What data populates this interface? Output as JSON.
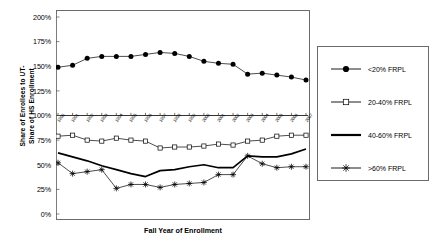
{
  "chart_data": {
    "type": "line",
    "title": "",
    "xlabel": "Fall Year of Enrollment",
    "ylabel": "Share of Enrollees to UT- Share of HS Enrollment",
    "ylabel_lines": [
      "Share of Enrollees to UT-",
      "Share of HS Enrollment"
    ],
    "x": [
      1990,
      1991,
      1992,
      1993,
      1994,
      1995,
      1996,
      1997,
      1998,
      1999,
      2000,
      2001,
      2002,
      2003,
      2004,
      2005,
      2006,
      2007
    ],
    "categories": [
      "1990",
      "1991",
      "1992",
      "1993",
      "1994",
      "1995",
      "1996",
      "1997",
      "1998",
      "1999",
      "2000",
      "2001",
      "2002",
      "2003",
      "2004",
      "2005",
      "2006",
      "2007"
    ],
    "ylim": [
      0,
      200
    ],
    "yticks": [
      0,
      25,
      50,
      75,
      100,
      125,
      150,
      175,
      200
    ],
    "ytick_labels": [
      "0%",
      "25%",
      "50%",
      "75%",
      "100%",
      "125%",
      "150%",
      "175%",
      "200%"
    ],
    "grid": false,
    "legend_position": "right",
    "series": [
      {
        "name": "<20% FRPL",
        "marker": "filled-circle",
        "values": [
          149,
          151,
          158,
          160,
          160,
          160,
          162,
          164,
          163,
          160,
          155,
          153,
          152,
          142,
          143,
          141,
          139,
          136
        ]
      },
      {
        "name": "20-40% FRPL",
        "marker": "open-square",
        "values": [
          79,
          80,
          75,
          74,
          77,
          75,
          74,
          67,
          68,
          68,
          69,
          71,
          70,
          74,
          75,
          79,
          80,
          80
        ]
      },
      {
        "name": "40-60% FRPL",
        "marker": "none",
        "values": [
          62,
          58,
          54,
          49,
          45,
          41,
          38,
          44,
          45,
          48,
          50,
          47,
          47,
          59,
          58,
          58,
          61,
          66
        ]
      },
      {
        "name": ">60% FRPL",
        "marker": "star",
        "values": [
          52,
          41,
          43,
          45,
          26,
          30,
          30,
          27,
          30,
          31,
          32,
          40,
          40,
          59,
          51,
          47,
          48,
          48
        ]
      }
    ]
  },
  "legend": {
    "items": [
      {
        "label": "<20% FRPL",
        "marker": "filled-circle"
      },
      {
        "label": "20-40% FRPL",
        "marker": "open-square"
      },
      {
        "label": "40-60% FRPL",
        "marker": "none"
      },
      {
        "label": ">60% FRPL",
        "marker": "star"
      }
    ]
  },
  "colors": {
    "line": "#000000",
    "frame": "#6b6b6b",
    "background": "#ffffff"
  }
}
